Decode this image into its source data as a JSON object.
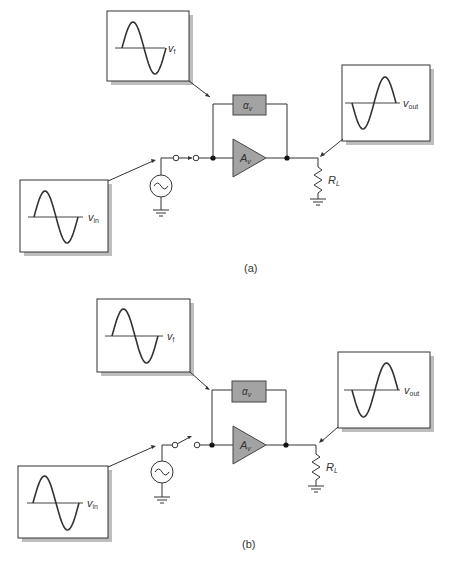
{
  "figure": {
    "panels": [
      {
        "id": "a",
        "caption": "(a)",
        "switch_state": "closed",
        "waveforms": {
          "feedback": {
            "symbol": "v",
            "subscript": "f",
            "phase": "in-phase"
          },
          "output": {
            "symbol": "v",
            "subscript": "out",
            "phase": "inverted"
          },
          "input": {
            "symbol": "v",
            "subscript": "in",
            "phase": "in-phase"
          }
        },
        "blocks": {
          "feedback": {
            "symbol": "α",
            "subscript": "v"
          },
          "amplifier": {
            "symbol": "A",
            "subscript": "v"
          },
          "load": {
            "symbol": "R",
            "subscript": "L"
          }
        }
      },
      {
        "id": "b",
        "caption": "(b)",
        "switch_state": "open",
        "waveforms": {
          "feedback": {
            "symbol": "v",
            "subscript": "f",
            "phase": "in-phase"
          },
          "output": {
            "symbol": "v",
            "subscript": "out",
            "phase": "inverted"
          },
          "input": {
            "symbol": "v",
            "subscript": "in",
            "phase": "in-phase"
          }
        },
        "blocks": {
          "feedback": {
            "symbol": "α",
            "subscript": "v"
          },
          "amplifier": {
            "symbol": "A",
            "subscript": "v"
          },
          "load": {
            "symbol": "R",
            "subscript": "L"
          }
        }
      }
    ],
    "colors": {
      "block_fill": "#a3a3a3",
      "line": "#333333",
      "shadow": "#bdbdbd"
    }
  }
}
